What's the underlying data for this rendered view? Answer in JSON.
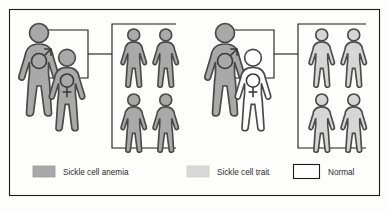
{
  "figure": {
    "background_color": "#fdfdfb",
    "border_color": "#1a1a1a"
  },
  "colors": {
    "anemia_fill": "#a9a9a9",
    "trait_fill": "#d6d6d6",
    "normal_fill": "#ffffff",
    "outline": "#4a4a4a",
    "line": "#1a1a1a",
    "text": "#2b2b2b"
  },
  "crosses": [
    {
      "name": "left-cross",
      "parents": [
        {
          "name": "father",
          "sex": "male",
          "sex_symbol": "male-symbol",
          "phenotype": "Sickle cell anemia",
          "fill": "anemia_fill"
        },
        {
          "name": "mother",
          "sex": "female",
          "sex_symbol": "female-symbol",
          "phenotype": "Sickle cell anemia",
          "fill": "anemia_fill"
        }
      ],
      "offspring_count": 4,
      "offspring": [
        {
          "name": "child-1",
          "phenotype": "Sickle cell anemia",
          "fill": "anemia_fill"
        },
        {
          "name": "child-2",
          "phenotype": "Sickle cell anemia",
          "fill": "anemia_fill"
        },
        {
          "name": "child-3",
          "phenotype": "Sickle cell anemia",
          "fill": "anemia_fill"
        },
        {
          "name": "child-4",
          "phenotype": "Sickle cell anemia",
          "fill": "anemia_fill"
        }
      ]
    },
    {
      "name": "right-cross",
      "parents": [
        {
          "name": "father",
          "sex": "male",
          "sex_symbol": "male-symbol",
          "phenotype": "Sickle cell anemia",
          "fill": "anemia_fill"
        },
        {
          "name": "mother",
          "sex": "female",
          "sex_symbol": "female-symbol",
          "phenotype": "Normal",
          "fill": "normal_fill"
        }
      ],
      "offspring_count": 4,
      "offspring": [
        {
          "name": "child-1",
          "phenotype": "Sickle cell trait",
          "fill": "trait_fill"
        },
        {
          "name": "child-2",
          "phenotype": "Sickle cell trait",
          "fill": "trait_fill"
        },
        {
          "name": "child-3",
          "phenotype": "Sickle cell trait",
          "fill": "trait_fill"
        },
        {
          "name": "child-4",
          "phenotype": "Sickle cell trait",
          "fill": "trait_fill"
        }
      ]
    }
  ],
  "legend": {
    "items": [
      {
        "label": "Sickle cell anemia",
        "swatch_fill": "#a9a9a9",
        "swatch_stroke": "#9a9a9a"
      },
      {
        "label": "Sickle cell trait",
        "swatch_fill": "#d8d8d8",
        "swatch_stroke": "#cccccc"
      },
      {
        "label": "Normal",
        "swatch_fill": "#ffffff",
        "swatch_stroke": "#1a1a1a"
      }
    ]
  }
}
